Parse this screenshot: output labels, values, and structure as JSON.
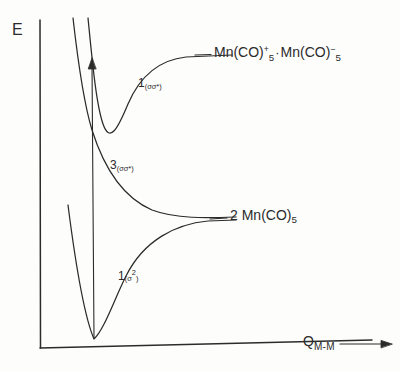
{
  "figure": {
    "caption": "Potential energy curves for Mn2(CO)10 along the metal-metal coordinate",
    "ink_color": "#2b2b2b",
    "paper_color": "#fdfdfb"
  },
  "axes": {
    "y_label": "E",
    "x_label_main": "Q",
    "x_label_sub": "M-M",
    "x_arrow_icon": "right-arrow-icon"
  },
  "asymptotes": [
    {
      "id": "ion-pair",
      "text_parts": {
        "left_species": "Mn(CO)",
        "left_sub": "5",
        "left_sup": "+",
        "separator": "·",
        "right_species": "Mn(CO)",
        "right_sub": "5",
        "right_sup": "−"
      }
    },
    {
      "id": "radical-pair",
      "text_parts": {
        "coefficient": "2",
        "species": "Mn(CO)",
        "sub": "5"
      }
    }
  ],
  "states": [
    {
      "id": "singlet-sigma-sigma-star",
      "multiplicity": "1",
      "configuration_open": "(",
      "configuration": "σσ*",
      "configuration_close": ")"
    },
    {
      "id": "triplet-sigma-sigma-star",
      "multiplicity": "3",
      "configuration_open": "(",
      "configuration": "σσ*",
      "configuration_close": ")"
    },
    {
      "id": "singlet-sigma-squared",
      "multiplicity": "1",
      "configuration_open": "(",
      "configuration": "σ",
      "configuration_sup": "2",
      "configuration_close": ")"
    }
  ],
  "annotations": {
    "excitation_arrow": "vertical-excitation-arrow"
  },
  "chart_data": {
    "type": "line",
    "title": "",
    "xlabel": "Q(M-M)",
    "ylabel": "E",
    "grid": false,
    "legend": "inline-annotations",
    "xlim": [
      40,
      370
    ],
    "ylim_pixels_note": "y increases downward in screen space; lower pixel y = higher energy",
    "series": [
      {
        "name": "1(sigma-sigma*)",
        "label": "¹(σσ*)",
        "type": "bound-excited",
        "asymptote_label": "Mn(CO)5+ · Mn(CO)5-",
        "minimum_px": [
          105,
          125
        ],
        "asymptote_y_px": 57,
        "left_wall_top_px": [
          88,
          18
        ],
        "path": "M 88 18 C 92 58, 96 104, 103 124 C 110 144, 118 128, 128 104 C 140 76, 158 60, 186 57 L 232 55"
      },
      {
        "name": "3(sigma-sigma*)",
        "label": "³(σσ*)",
        "type": "repulsive",
        "asymptote_label": "2 Mn(CO)5",
        "left_wall_top_px": [
          73,
          18
        ],
        "asymptote_y_px": 216,
        "path": "M 73 18 C 78 62, 84 104, 92 130 C 104 168, 124 198, 152 210 C 176 219, 206 218, 236 217"
      },
      {
        "name": "1(sigma^2)",
        "label": "¹(σ²)",
        "type": "bound-ground",
        "asymptote_label": "2 Mn(CO)5",
        "minimum_px": [
          94,
          339
        ],
        "asymptote_y_px": 221,
        "left_wall_top_px": [
          68,
          205
        ],
        "path": "M 68 205 C 74 252, 84 316, 94 339 C 104 330, 114 300, 126 276 C 144 240, 176 224, 208 221 L 236 220"
      }
    ],
    "arrow": {
      "name": "vertical-excitation-arrow",
      "from_px": [
        94,
        338
      ],
      "to_px": [
        92,
        60
      ],
      "head": "filled-triangle"
    },
    "asymptote_tick_lines": [
      {
        "name": "ion-pair-tick",
        "from_px": [
          192,
          56
        ],
        "to_px": [
          212,
          55
        ]
      },
      {
        "name": "radical-pair-tick",
        "from_px": [
          208,
          219
        ],
        "to_px": [
          228,
          218
        ]
      }
    ]
  }
}
